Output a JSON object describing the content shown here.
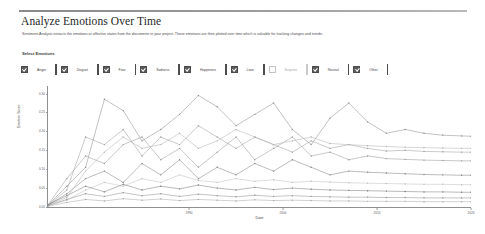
{
  "header": {
    "title": "Analyze Emotions Over Time",
    "description": "Sentiment Analysis extracts the emotions or affective states from the documents in your project. These emotions are then plotted over time which is valuable for tracking changes and trends."
  },
  "controls": {
    "section_label": "Select Emotions",
    "emotions": [
      {
        "label": "Anger",
        "checked": true,
        "color": "#7a7a7a"
      },
      {
        "label": "Disgust",
        "checked": true,
        "color": "#8a8a8a"
      },
      {
        "label": "Fear",
        "checked": true,
        "color": "#969696"
      },
      {
        "label": "Sadness",
        "checked": true,
        "color": "#8f8f8f"
      },
      {
        "label": "Happiness",
        "checked": true,
        "color": "#a2a2a2"
      },
      {
        "label": "Love",
        "checked": true,
        "color": "#b0b0b0"
      },
      {
        "label": "Surprise",
        "checked": false,
        "color": "#c4c4c4"
      },
      {
        "label": "Neutral",
        "checked": true,
        "color": "#8c8c8c"
      },
      {
        "label": "Other",
        "checked": true,
        "color": "#9e9e9e"
      }
    ]
  },
  "chart_data": {
    "type": "line",
    "title": "",
    "xlabel": "Date",
    "ylabel": "Emotion Score",
    "grid": false,
    "legend": "none",
    "ylim": [
      0.0,
      0.32
    ],
    "xlim": [
      1975,
      2020
    ],
    "ytick_labels": [
      "0.30",
      "0.25",
      "0.20",
      "0.15",
      "0.10",
      "0.05",
      "0.00"
    ],
    "ytick_values": [
      0.3,
      0.25,
      0.2,
      0.15,
      0.1,
      0.05,
      0.0
    ],
    "xtick_labels": [
      "1990",
      "2000",
      "2010",
      "2020"
    ],
    "xtick_values": [
      1990,
      2000,
      2010,
      2020
    ],
    "x": [
      1975,
      1977,
      1979,
      1981,
      1983,
      1985,
      1987,
      1989,
      1991,
      1993,
      1995,
      1997,
      1999,
      2001,
      2003,
      2005,
      2007,
      2009,
      2011,
      2013,
      2015,
      2017,
      2019,
      2020
    ],
    "series": [
      {
        "name": "Anger",
        "color": "#8f8f8f",
        "values": [
          0.005,
          0.055,
          0.105,
          0.285,
          0.255,
          0.175,
          0.205,
          0.245,
          0.295,
          0.265,
          0.215,
          0.245,
          0.275,
          0.205,
          0.165,
          0.235,
          0.275,
          0.225,
          0.195,
          0.205,
          0.195,
          0.19,
          0.188,
          0.187
        ]
      },
      {
        "name": "Disgust",
        "color": "#a0a0a0",
        "values": [
          0.004,
          0.045,
          0.185,
          0.165,
          0.205,
          0.135,
          0.185,
          0.165,
          0.215,
          0.185,
          0.155,
          0.185,
          0.165,
          0.145,
          0.175,
          0.155,
          0.165,
          0.155,
          0.148,
          0.15,
          0.147,
          0.146,
          0.145,
          0.145
        ]
      },
      {
        "name": "Fear",
        "color": "#9a9a9a",
        "values": [
          0.006,
          0.075,
          0.135,
          0.115,
          0.165,
          0.185,
          0.125,
          0.155,
          0.105,
          0.145,
          0.185,
          0.125,
          0.155,
          0.185,
          0.135,
          0.145,
          0.125,
          0.135,
          0.128,
          0.126,
          0.124,
          0.123,
          0.122,
          0.122
        ]
      },
      {
        "name": "Sadness",
        "color": "#868686",
        "values": [
          0.005,
          0.035,
          0.075,
          0.095,
          0.065,
          0.115,
          0.085,
          0.125,
          0.075,
          0.105,
          0.085,
          0.115,
          0.095,
          0.125,
          0.105,
          0.085,
          0.095,
          0.092,
          0.09,
          0.088,
          0.086,
          0.085,
          0.084,
          0.084
        ]
      },
      {
        "name": "Happiness",
        "color": "#b4b4b4",
        "values": [
          0.004,
          0.025,
          0.095,
          0.145,
          0.185,
          0.155,
          0.165,
          0.195,
          0.155,
          0.175,
          0.205,
          0.185,
          0.165,
          0.175,
          0.185,
          0.168,
          0.165,
          0.162,
          0.16,
          0.158,
          0.157,
          0.156,
          0.155,
          0.155
        ]
      },
      {
        "name": "Love",
        "color": "#c0c0c0",
        "values": [
          0.003,
          0.018,
          0.045,
          0.065,
          0.055,
          0.075,
          0.065,
          0.085,
          0.07,
          0.065,
          0.075,
          0.068,
          0.072,
          0.065,
          0.068,
          0.066,
          0.064,
          0.063,
          0.062,
          0.061,
          0.06,
          0.06,
          0.059,
          0.059
        ]
      },
      {
        "name": "Neutral",
        "color": "#7e7e7e",
        "values": [
          0.006,
          0.03,
          0.055,
          0.04,
          0.06,
          0.045,
          0.055,
          0.048,
          0.058,
          0.05,
          0.045,
          0.052,
          0.046,
          0.05,
          0.047,
          0.045,
          0.044,
          0.043,
          0.042,
          0.041,
          0.04,
          0.04,
          0.039,
          0.039
        ]
      },
      {
        "name": "Other",
        "color": "#949494",
        "values": [
          0.004,
          0.02,
          0.035,
          0.028,
          0.038,
          0.03,
          0.035,
          0.028,
          0.034,
          0.03,
          0.027,
          0.031,
          0.028,
          0.03,
          0.028,
          0.027,
          0.026,
          0.026,
          0.025,
          0.025,
          0.024,
          0.024,
          0.024,
          0.024
        ]
      },
      {
        "name": "Additional",
        "color": "#aaaaaa",
        "values": [
          0.002,
          0.012,
          0.02,
          0.016,
          0.022,
          0.018,
          0.021,
          0.017,
          0.02,
          0.018,
          0.016,
          0.019,
          0.017,
          0.018,
          0.017,
          0.016,
          0.016,
          0.015,
          0.015,
          0.015,
          0.014,
          0.014,
          0.014,
          0.014
        ]
      }
    ]
  }
}
